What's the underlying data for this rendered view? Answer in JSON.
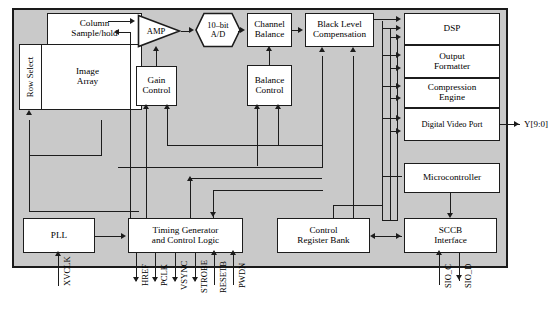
{
  "diagram": {
    "die_fill": "#c9c9c9",
    "block_fill": "#ffffff",
    "line_color": "#1c1c1c"
  },
  "blocks": {
    "row_select": "Row Select",
    "column_sample_hold_l1": "Column",
    "column_sample_hold_l2": "Sample/hold",
    "image_array_l1": "Image",
    "image_array_l2": "Array",
    "amp": "AMP",
    "ad_l1": "10–bit",
    "ad_l2": "A/D",
    "gain_control_l1": "Gain",
    "gain_control_l2": "Control",
    "channel_balance_l1": "Channel",
    "channel_balance_l2": "Balance",
    "balance_control_l1": "Balance",
    "balance_control_l2": "Control",
    "black_level_l1": "Black Level",
    "black_level_l2": "Compensation",
    "dsp": "DSP",
    "output_formatter_l1": "Output",
    "output_formatter_l2": "Formatter",
    "compression_engine_l1": "Compression",
    "compression_engine_l2": "Engine",
    "digital_video_port": "Digital Video Port",
    "microcontroller": "Microcontroller",
    "pll": "PLL",
    "timing_generator_l1": "Timing Generator",
    "timing_generator_l2": "and Control Logic",
    "control_register_bank_l1": "Control",
    "control_register_bank_l2": "Register Bank",
    "sccb_l1": "SCCB",
    "sccb_l2": "Interface"
  },
  "pins": {
    "xvclk": "XVCLK",
    "href": "HREF",
    "pclk": "PCLK",
    "vsync": "VSYNC",
    "strobe": "STROBE",
    "resetb": "RESETB",
    "pwdn": "PWDN",
    "sio_c": "SIO_C",
    "sio_d": "SIO_D",
    "y_bus": "Y[9:0]"
  }
}
